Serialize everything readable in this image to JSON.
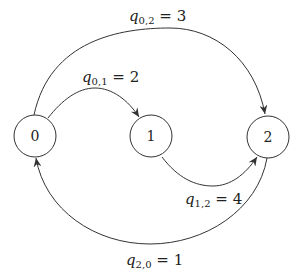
{
  "diagram": {
    "type": "state transition graph",
    "nodes": [
      {
        "id": "0",
        "label": "0"
      },
      {
        "id": "1",
        "label": "1"
      },
      {
        "id": "2",
        "label": "2"
      }
    ],
    "edges": [
      {
        "from": "0",
        "to": "1",
        "symbol": "q",
        "sub": "0,1",
        "eq": " = ",
        "value": "2"
      },
      {
        "from": "0",
        "to": "2",
        "symbol": "q",
        "sub": "0,2",
        "eq": " = ",
        "value": "3"
      },
      {
        "from": "1",
        "to": "2",
        "symbol": "q",
        "sub": "1,2",
        "eq": " = ",
        "value": "4"
      },
      {
        "from": "2",
        "to": "0",
        "symbol": "q",
        "sub": "2,0",
        "eq": " = ",
        "value": "1"
      }
    ],
    "colors": {
      "stroke": "#333333",
      "text": "#222222",
      "background": "#ffffff"
    }
  }
}
